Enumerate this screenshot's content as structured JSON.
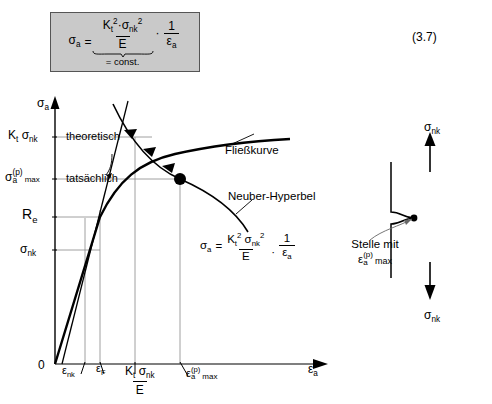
{
  "equation_number": "(3.7)",
  "formula_box": {
    "lhs": "σ",
    "lhs_sub": "a",
    "equals": "=",
    "numerator": {
      "k": "K",
      "k_sub": "t",
      "k_sup": "2",
      "dot": "·",
      "sigma": "σ",
      "sigma_sub": "nk",
      "sigma_sup": "2"
    },
    "denominator": "E",
    "const_label": "= const.",
    "multiplier_dot": "·",
    "factor_num": "1",
    "factor_den": "ε",
    "factor_den_sub": "a"
  },
  "graph": {
    "y_axis_label": {
      "sym": "σ",
      "sub": "a"
    },
    "x_axis_label": {
      "sym": "ε",
      "sub": "a"
    },
    "origin_label": "0",
    "y_ticks": [
      {
        "id": "kt-sigma-nk",
        "text": "K",
        "sub1": "t",
        "text2": "σ",
        "sub2": "nk"
      },
      {
        "id": "sigma-a-p-max",
        "text": "σ",
        "sub_a": "a",
        "sup_p": "(p)",
        "max": "max"
      },
      {
        "id": "re",
        "text": "R",
        "sub": "e"
      },
      {
        "id": "sigma-nk",
        "text": "σ",
        "sub": "nk"
      }
    ],
    "x_ticks": [
      {
        "id": "eps-nk",
        "text": "ε",
        "sub": "nk"
      },
      {
        "id": "eps-f",
        "text": "ε",
        "sub": "F"
      },
      {
        "id": "kt-sigma-nk-over-e",
        "num_k": "K",
        "num_k_sub": "t",
        "num_sigma": "σ",
        "num_sigma_sub": "nk",
        "den": "E"
      },
      {
        "id": "eps-a-p-max",
        "text": "ε",
        "sup": "(p)",
        "sub_a": "a",
        "max": "max"
      }
    ],
    "annotations": [
      {
        "id": "theoretisch",
        "text": "theoretisch"
      },
      {
        "id": "tatsaechlich",
        "text": "tatsächlich"
      },
      {
        "id": "fliesskurve",
        "text": "Fließkurve"
      },
      {
        "id": "neuber-hyperbel",
        "text": "Neuber-Hyperbel"
      }
    ],
    "inline_equation": {
      "lhs": "σ",
      "lhs_sub": "a",
      "equals": "=",
      "num_k": "K",
      "num_k_sub": "t",
      "num_k_sup": "2",
      "num_sigma": "σ",
      "num_sigma_sub": "nk",
      "num_sigma_sup": "2",
      "den": "E",
      "dot": "·",
      "factor_num": "1",
      "factor_den": "ε",
      "factor_den_sub": "a"
    }
  },
  "specimen": {
    "top_label": {
      "sym": "σ",
      "sub": "nk"
    },
    "bottom_label": {
      "sym": "σ",
      "sub": "nk"
    },
    "callout_line1": "Stelle mit",
    "callout_sym": "ε",
    "callout_sup": "(p)",
    "callout_sub": "a",
    "callout_max": "max"
  },
  "colors": {
    "ink": "#000000",
    "box_fill": "#c9c9c9",
    "box_border": "#555555",
    "thin_line": "#777777"
  }
}
